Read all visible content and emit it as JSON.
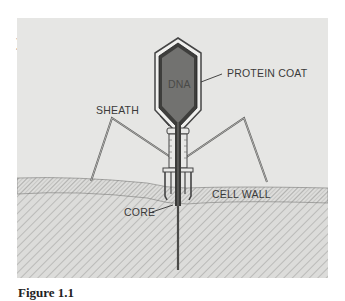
{
  "figure": {
    "panel_mark": ")",
    "caption": "Figure 1.1",
    "colors": {
      "background": "#e6e6e4",
      "head_fill": "#6e6e6c",
      "outline": "#3a3a3a",
      "cell_wall": "#d2d2d0"
    },
    "labels": {
      "dna": "DNA",
      "protein_coat": "PROTEIN COAT",
      "sheath": "SHEATH",
      "core": "CORE",
      "cell_wall": "CELL WALL"
    }
  }
}
